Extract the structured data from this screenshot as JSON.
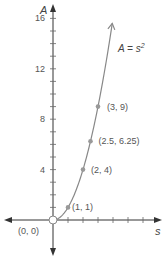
{
  "chart_data": {
    "type": "line",
    "title": "",
    "xlabel": "s",
    "ylabel": "A",
    "equation_label": "A = s",
    "equation_exponent": "2",
    "yticks": [
      4,
      8,
      12,
      16
    ],
    "ytick_labels": [
      "4",
      "8",
      "12",
      "16"
    ],
    "ylim": [
      0,
      17
    ],
    "xlim": [
      0,
      5.5
    ],
    "grid": false,
    "series": [
      {
        "name": "A = s^2",
        "function": "s^2",
        "points": [
          {
            "x": 0,
            "y": 0,
            "label": "(0, 0)",
            "open": true
          },
          {
            "x": 1,
            "y": 1,
            "label": "(1, 1)"
          },
          {
            "x": 2,
            "y": 4,
            "label": "(2, 4)"
          },
          {
            "x": 2.5,
            "y": 6.25,
            "label": "(2.5, 6.25)"
          },
          {
            "x": 3,
            "y": 9,
            "label": "(3, 9)"
          }
        ]
      }
    ],
    "colors": {
      "axis": "#333333",
      "curve": "#888888",
      "point": "#999999",
      "text": "#555555"
    }
  }
}
